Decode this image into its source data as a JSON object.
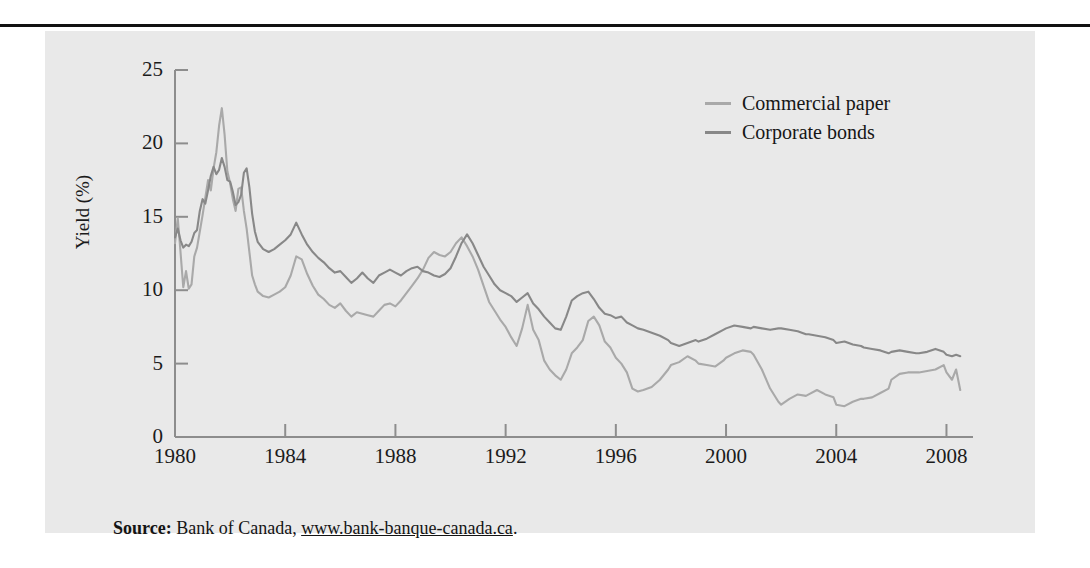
{
  "figure": {
    "panel_bg": "#e9e9e9",
    "rule_color": "#111111"
  },
  "source": {
    "label": "Source:",
    "text": " Bank of Canada, ",
    "url": "www.bank-banque-canada.ca",
    "period": "."
  },
  "chart_data": {
    "type": "line",
    "title": "",
    "xlabel": "",
    "ylabel": "Yield (%)",
    "xlim": [
      1980,
      2008.6
    ],
    "ylim": [
      0,
      25
    ],
    "grid": false,
    "legend_position": "top-right",
    "xticks": [
      1980,
      1984,
      1988,
      1992,
      1996,
      2000,
      2004,
      2008
    ],
    "xtick_labels": [
      "1980",
      "1984",
      "1988",
      "1992",
      "1996",
      "2000",
      "2004",
      "2008"
    ],
    "yticks": [
      0,
      5,
      10,
      15,
      20,
      25
    ],
    "ytick_labels": [
      "0",
      "5",
      "10",
      "15",
      "20",
      "25"
    ],
    "series": [
      {
        "name": "Commercial paper",
        "color": "#a9a9a9",
        "x": [
          1980.0,
          1980.1,
          1980.2,
          1980.3,
          1980.4,
          1980.5,
          1980.6,
          1980.7,
          1980.8,
          1980.9,
          1981.0,
          1981.1,
          1981.2,
          1981.3,
          1981.4,
          1981.5,
          1981.6,
          1981.7,
          1981.8,
          1981.9,
          1982.0,
          1982.1,
          1982.2,
          1982.3,
          1982.4,
          1982.5,
          1982.6,
          1982.7,
          1982.8,
          1982.9,
          1983.0,
          1983.2,
          1983.4,
          1983.6,
          1983.8,
          1984.0,
          1984.2,
          1984.4,
          1984.6,
          1984.8,
          1985.0,
          1985.2,
          1985.4,
          1985.6,
          1985.8,
          1986.0,
          1986.2,
          1986.4,
          1986.6,
          1986.8,
          1987.0,
          1987.2,
          1987.4,
          1987.6,
          1987.8,
          1988.0,
          1988.2,
          1988.4,
          1988.6,
          1988.8,
          1989.0,
          1989.2,
          1989.4,
          1989.6,
          1989.8,
          1990.0,
          1990.2,
          1990.4,
          1990.6,
          1990.8,
          1991.0,
          1991.2,
          1991.4,
          1991.6,
          1991.8,
          1992.0,
          1992.2,
          1992.4,
          1992.6,
          1992.8,
          1993.0,
          1993.2,
          1993.4,
          1993.6,
          1993.8,
          1994.0,
          1994.2,
          1994.4,
          1994.6,
          1994.8,
          1995.0,
          1995.2,
          1995.4,
          1995.6,
          1995.8,
          1996.0,
          1996.2,
          1996.4,
          1996.6,
          1996.8,
          1997.0,
          1997.3,
          1997.6,
          1997.9,
          1998.0,
          1998.3,
          1998.6,
          1998.9,
          1999.0,
          1999.3,
          1999.6,
          1999.9,
          2000.0,
          2000.3,
          2000.6,
          2000.9,
          2001.0,
          2001.3,
          2001.6,
          2001.9,
          2002.0,
          2002.3,
          2002.6,
          2002.9,
          2003.0,
          2003.3,
          2003.6,
          2003.9,
          2004.0,
          2004.3,
          2004.6,
          2004.9,
          2005.0,
          2005.3,
          2005.6,
          2005.9,
          2006.0,
          2006.3,
          2006.6,
          2006.9,
          2007.0,
          2007.3,
          2007.6,
          2007.9,
          2008.0,
          2008.2,
          2008.35,
          2008.5
        ],
        "y": [
          13.2,
          14.9,
          12.6,
          10.2,
          11.3,
          10.1,
          10.4,
          12.3,
          12.9,
          14.0,
          15.1,
          16.3,
          17.5,
          16.8,
          18.3,
          19.4,
          21.2,
          22.4,
          20.6,
          18.1,
          17.3,
          16.2,
          15.4,
          16.9,
          17.0,
          15.4,
          14.2,
          12.6,
          11.0,
          10.4,
          9.9,
          9.6,
          9.5,
          9.7,
          9.9,
          10.2,
          11.0,
          12.3,
          12.1,
          11.1,
          10.3,
          9.7,
          9.4,
          9.0,
          8.8,
          9.1,
          8.6,
          8.2,
          8.5,
          8.4,
          8.3,
          8.2,
          8.6,
          9.0,
          9.1,
          8.9,
          9.3,
          9.8,
          10.3,
          10.8,
          11.4,
          12.2,
          12.6,
          12.4,
          12.3,
          12.6,
          13.2,
          13.6,
          13.0,
          12.3,
          11.4,
          10.3,
          9.2,
          8.6,
          8.0,
          7.5,
          6.8,
          6.2,
          7.4,
          9.0,
          7.3,
          6.6,
          5.2,
          4.6,
          4.2,
          3.9,
          4.6,
          5.7,
          6.1,
          6.6,
          7.9,
          8.2,
          7.6,
          6.5,
          6.1,
          5.4,
          5.0,
          4.4,
          3.3,
          3.1,
          3.2,
          3.4,
          3.9,
          4.6,
          4.9,
          5.1,
          5.5,
          5.2,
          5.0,
          4.9,
          4.8,
          5.2,
          5.4,
          5.7,
          5.9,
          5.8,
          5.6,
          4.6,
          3.3,
          2.4,
          2.2,
          2.6,
          2.9,
          2.8,
          2.9,
          3.2,
          2.9,
          2.7,
          2.2,
          2.1,
          2.4,
          2.6,
          2.6,
          2.7,
          3.0,
          3.3,
          3.9,
          4.3,
          4.4,
          4.4,
          4.4,
          4.5,
          4.6,
          4.9,
          4.4,
          3.9,
          4.6,
          3.2
        ]
      },
      {
        "name": "Corporate bonds",
        "color": "#888888",
        "x": [
          1980.0,
          1980.1,
          1980.2,
          1980.3,
          1980.4,
          1980.5,
          1980.6,
          1980.7,
          1980.8,
          1980.9,
          1981.0,
          1981.1,
          1981.2,
          1981.3,
          1981.4,
          1981.5,
          1981.6,
          1981.7,
          1981.8,
          1981.9,
          1982.0,
          1982.1,
          1982.2,
          1982.3,
          1982.4,
          1982.5,
          1982.6,
          1982.7,
          1982.8,
          1982.9,
          1983.0,
          1983.2,
          1983.4,
          1983.6,
          1983.8,
          1984.0,
          1984.2,
          1984.4,
          1984.6,
          1984.8,
          1985.0,
          1985.2,
          1985.4,
          1985.6,
          1985.8,
          1986.0,
          1986.2,
          1986.4,
          1986.6,
          1986.8,
          1987.0,
          1987.2,
          1987.4,
          1987.6,
          1987.8,
          1988.0,
          1988.2,
          1988.4,
          1988.6,
          1988.8,
          1989.0,
          1989.2,
          1989.4,
          1989.6,
          1989.8,
          1990.0,
          1990.2,
          1990.4,
          1990.6,
          1990.8,
          1991.0,
          1991.2,
          1991.4,
          1991.6,
          1991.8,
          1992.0,
          1992.2,
          1992.4,
          1992.6,
          1992.8,
          1993.0,
          1993.2,
          1993.4,
          1993.6,
          1993.8,
          1994.0,
          1994.2,
          1994.4,
          1994.6,
          1994.8,
          1995.0,
          1995.2,
          1995.4,
          1995.6,
          1995.8,
          1996.0,
          1996.2,
          1996.4,
          1996.6,
          1996.8,
          1997.0,
          1997.3,
          1997.6,
          1997.9,
          1998.0,
          1998.3,
          1998.6,
          1998.9,
          1999.0,
          1999.3,
          1999.6,
          1999.9,
          2000.0,
          2000.3,
          2000.6,
          2000.9,
          2001.0,
          2001.3,
          2001.6,
          2001.9,
          2002.0,
          2002.3,
          2002.6,
          2002.9,
          2003.0,
          2003.3,
          2003.6,
          2003.9,
          2004.0,
          2004.3,
          2004.6,
          2004.9,
          2005.0,
          2005.3,
          2005.6,
          2005.9,
          2006.0,
          2006.3,
          2006.6,
          2006.9,
          2007.0,
          2007.3,
          2007.6,
          2007.9,
          2008.0,
          2008.2,
          2008.35,
          2008.5
        ],
        "y": [
          13.6,
          14.2,
          13.4,
          12.9,
          13.1,
          13.0,
          13.3,
          13.9,
          14.1,
          15.4,
          16.2,
          15.9,
          16.8,
          17.8,
          18.4,
          17.9,
          18.2,
          19.0,
          18.4,
          17.5,
          17.4,
          16.7,
          15.8,
          16.0,
          16.5,
          18.0,
          18.3,
          17.0,
          15.2,
          14.0,
          13.3,
          12.8,
          12.6,
          12.8,
          13.1,
          13.4,
          13.8,
          14.6,
          13.8,
          13.1,
          12.6,
          12.2,
          11.9,
          11.5,
          11.2,
          11.3,
          10.9,
          10.5,
          10.8,
          11.2,
          10.8,
          10.5,
          11.0,
          11.2,
          11.4,
          11.2,
          11.0,
          11.3,
          11.5,
          11.6,
          11.3,
          11.2,
          11.0,
          10.9,
          11.1,
          11.5,
          12.3,
          13.2,
          13.8,
          13.2,
          12.4,
          11.6,
          11.0,
          10.4,
          10.0,
          9.8,
          9.6,
          9.2,
          9.5,
          9.8,
          9.1,
          8.7,
          8.2,
          7.8,
          7.4,
          7.3,
          8.2,
          9.3,
          9.6,
          9.8,
          9.9,
          9.4,
          8.8,
          8.4,
          8.3,
          8.1,
          8.2,
          7.8,
          7.6,
          7.4,
          7.3,
          7.1,
          6.9,
          6.6,
          6.4,
          6.2,
          6.4,
          6.6,
          6.5,
          6.7,
          7.0,
          7.3,
          7.4,
          7.6,
          7.5,
          7.4,
          7.5,
          7.4,
          7.3,
          7.4,
          7.4,
          7.3,
          7.2,
          7.0,
          7.0,
          6.9,
          6.8,
          6.6,
          6.4,
          6.5,
          6.3,
          6.2,
          6.1,
          6.0,
          5.9,
          5.7,
          5.8,
          5.9,
          5.8,
          5.7,
          5.7,
          5.8,
          6.0,
          5.8,
          5.6,
          5.5,
          5.6,
          5.5
        ]
      }
    ]
  }
}
